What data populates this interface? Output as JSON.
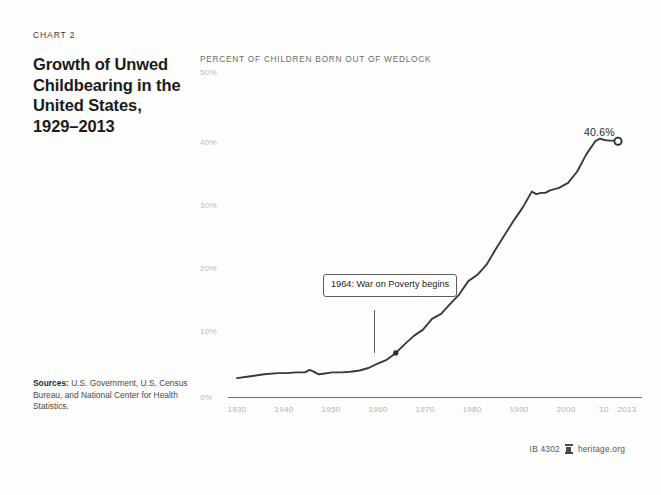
{
  "header": {
    "kicker": "CHART 2",
    "title": "Growth of Unwed Childbearing in the United States, 1929–2013"
  },
  "sources": {
    "label": "Sources:",
    "text": " U.S. Government, U.S. Census Bureau, and National Center for Health Statistics."
  },
  "footer": {
    "doc_id": "IB 4302",
    "logo_name": "heritage-foundation-logo",
    "site": "heritage.org"
  },
  "chart_data": {
    "type": "line",
    "title": "Growth of Unwed Childbearing in the United States, 1929–2013",
    "subtitle": "PERCENT OF CHILDREN BORN OUT OF WEDLOCK",
    "xlabel": "",
    "ylabel": "PERCENT OF CHILDREN BORN OUT OF WEDLOCK",
    "xlim": [
      1929,
      2013
    ],
    "ylim": [
      0,
      50
    ],
    "grid": false,
    "legend": false,
    "ytick_labels": [
      "50%",
      "40%",
      "30%",
      "20%",
      "10%",
      "0%"
    ],
    "ytick_values": [
      50,
      40,
      30,
      20,
      10,
      0
    ],
    "xtick_labels": [
      "1930",
      "1940",
      "1950",
      "1960",
      "1970",
      "1980",
      "1990",
      "2000",
      "'10",
      "2013"
    ],
    "xtick_values": [
      1930,
      1940,
      1950,
      1960,
      1970,
      1980,
      1990,
      2000,
      2010,
      2013
    ],
    "line_color": "#3a3a3a",
    "end_marker": {
      "x": 2013,
      "y": 40.6,
      "label": "40.6%"
    },
    "annotations": [
      {
        "label": "1964: War on Poverty begins",
        "x": 1964,
        "y": 7.0
      }
    ],
    "x": [
      1929,
      1932,
      1935,
      1938,
      1940,
      1942,
      1944,
      1945,
      1946,
      1947,
      1948,
      1950,
      1952,
      1954,
      1956,
      1958,
      1960,
      1962,
      1964,
      1966,
      1968,
      1970,
      1972,
      1974,
      1976,
      1978,
      1980,
      1982,
      1984,
      1986,
      1988,
      1990,
      1992,
      1994,
      1995,
      1996,
      1997,
      1998,
      1999,
      2000,
      2002,
      2004,
      2006,
      2008,
      2009,
      2010,
      2011,
      2012,
      2013
    ],
    "values": [
      3.0,
      3.3,
      3.6,
      3.8,
      3.8,
      3.9,
      3.9,
      4.3,
      4.0,
      3.6,
      3.7,
      3.9,
      3.9,
      4.0,
      4.2,
      4.6,
      5.3,
      5.9,
      7.0,
      8.4,
      9.7,
      10.7,
      12.4,
      13.2,
      14.8,
      16.3,
      18.4,
      19.4,
      21.0,
      23.4,
      25.7,
      28.0,
      30.1,
      32.6,
      32.2,
      32.4,
      32.4,
      32.8,
      33.0,
      33.2,
      34.0,
      35.8,
      38.5,
      40.6,
      41.0,
      40.8,
      40.7,
      40.7,
      40.6
    ]
  }
}
